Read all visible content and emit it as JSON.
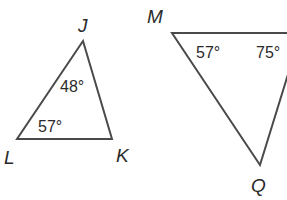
{
  "diagram": {
    "type": "geometry-triangles",
    "stroke_color": "#4a4a4a",
    "text_color": "#2a2a2a",
    "triangles": [
      {
        "name": "JKL",
        "vertices": {
          "J": {
            "label": "J",
            "x": 83,
            "y": 41
          },
          "K": {
            "label": "K",
            "x": 112,
            "y": 139
          },
          "L": {
            "label": "L",
            "x": 17,
            "y": 139
          }
        },
        "angles": [
          {
            "vertex": "J",
            "label": "48°"
          },
          {
            "vertex": "L",
            "label": "57°"
          }
        ]
      },
      {
        "name": "MQ (third vertex cropped)",
        "vertices": {
          "M": {
            "label": "M",
            "x": 172,
            "y": 33
          },
          "Q": {
            "label": "Q",
            "x": 260,
            "y": 165
          }
        },
        "angles": [
          {
            "vertex": "M",
            "label": "57°"
          },
          {
            "vertex": "third",
            "label": "75°"
          }
        ]
      }
    ]
  }
}
